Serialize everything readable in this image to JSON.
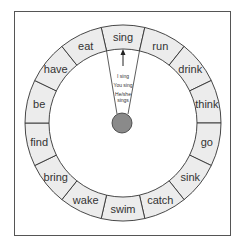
{
  "wheel": {
    "segments": [
      "sing",
      "run",
      "drink",
      "think",
      "go",
      "sink",
      "catch",
      "swim",
      "wake",
      "bring",
      "find",
      "be",
      "have",
      "eat"
    ],
    "selected": "sing",
    "ring_color": "#ececec",
    "hub_color": "#8a8a8a"
  },
  "pointer": {
    "lines": [
      "I sing",
      "You sing",
      "He/she",
      "sings"
    ]
  }
}
